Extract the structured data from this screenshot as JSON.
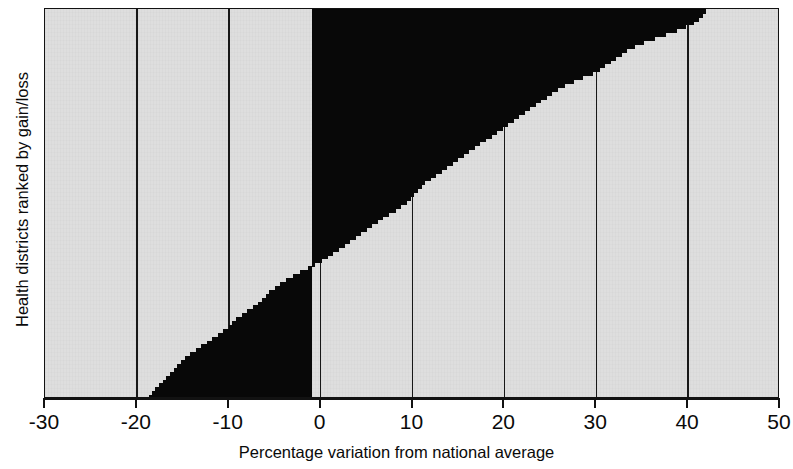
{
  "chart_data": {
    "type": "bar",
    "orientation": "horizontal",
    "title": "",
    "subtitle": "",
    "xlabel": "Percentage variation from national average",
    "ylabel": "Health districts ranked by gain/loss",
    "xlim": [
      -30,
      50
    ],
    "ylim": [
      0,
      100
    ],
    "xticks": [
      -30,
      -20,
      -10,
      0,
      10,
      20,
      30,
      40,
      50
    ],
    "xticklabels": [
      "-30",
      "-20",
      "-10",
      "0",
      "10",
      "20",
      "30",
      "40",
      "50"
    ],
    "yticks": [],
    "yticklabels": [],
    "grid": "vertical-only",
    "grid_color": "#181818",
    "legend": null,
    "bar_color": "#080808",
    "plot_background": "#dedede",
    "baseline": -0.9,
    "zero_crossing_fraction": 0.455,
    "categories": [
      "district-1",
      "district-2",
      "district-3",
      "district-4",
      "district-5",
      "district-6",
      "district-7",
      "district-8",
      "district-9",
      "district-10",
      "district-11",
      "district-12",
      "district-13",
      "district-14",
      "district-15",
      "district-16",
      "district-17",
      "district-18",
      "district-19",
      "district-20",
      "district-21",
      "district-22",
      "district-23",
      "district-24",
      "district-25",
      "district-26",
      "district-27",
      "district-28",
      "district-29",
      "district-30",
      "district-31",
      "district-32",
      "district-33",
      "district-34",
      "district-35",
      "district-36",
      "district-37",
      "district-38",
      "district-39",
      "district-40",
      "district-41",
      "district-42",
      "district-43",
      "district-44",
      "district-45",
      "district-46",
      "district-47",
      "district-48",
      "district-49",
      "district-50",
      "district-51",
      "district-52",
      "district-53",
      "district-54",
      "district-55",
      "district-56",
      "district-57",
      "district-58",
      "district-59",
      "district-60",
      "district-61",
      "district-62",
      "district-63",
      "district-64",
      "district-65",
      "district-66",
      "district-67",
      "district-68",
      "district-69",
      "district-70",
      "district-71",
      "district-72",
      "district-73",
      "district-74",
      "district-75",
      "district-76",
      "district-77",
      "district-78",
      "district-79",
      "district-80",
      "district-81",
      "district-82",
      "district-83",
      "district-84",
      "district-85",
      "district-86",
      "district-87",
      "district-88",
      "district-89",
      "district-90",
      "district-91",
      "district-92",
      "district-93",
      "district-94",
      "district-95",
      "district-96",
      "district-97",
      "district-98",
      "district-99",
      "district-100"
    ],
    "values": [
      42.0,
      41.6,
      41.2,
      40.6,
      39.8,
      38.8,
      37.6,
      36.4,
      35.2,
      34.2,
      33.4,
      32.8,
      32.2,
      31.6,
      31.0,
      30.4,
      29.6,
      28.6,
      27.6,
      26.6,
      25.8,
      25.2,
      24.6,
      24.0,
      23.4,
      22.8,
      22.2,
      21.6,
      21.0,
      20.4,
      19.8,
      19.2,
      18.6,
      18.0,
      17.4,
      16.8,
      16.2,
      15.6,
      15.0,
      14.4,
      13.8,
      13.2,
      12.6,
      12.0,
      11.4,
      11.0,
      10.6,
      10.2,
      9.8,
      9.4,
      8.8,
      8.2,
      7.4,
      6.8,
      6.2,
      5.6,
      5.0,
      4.4,
      3.8,
      3.2,
      2.6,
      2.0,
      1.4,
      0.8,
      0.2,
      -0.6,
      -1.4,
      -2.2,
      -3.0,
      -3.8,
      -4.4,
      -5.0,
      -5.6,
      -6.0,
      -6.4,
      -6.8,
      -7.4,
      -8.0,
      -8.6,
      -9.2,
      -9.6,
      -10.0,
      -10.6,
      -11.2,
      -11.8,
      -12.4,
      -13.0,
      -13.6,
      -14.2,
      -14.8,
      -15.2,
      -15.6,
      -16.0,
      -16.4,
      -16.8,
      -17.2,
      -17.6,
      -18.0,
      -18.4,
      -18.7
    ]
  },
  "axes": {
    "x_label": "Percentage variation from national average",
    "y_label": "Health districts ranked by gain/loss",
    "x_tick_labels": [
      "-30",
      "-20",
      "-10",
      "0",
      "10",
      "20",
      "30",
      "40",
      "50"
    ]
  }
}
